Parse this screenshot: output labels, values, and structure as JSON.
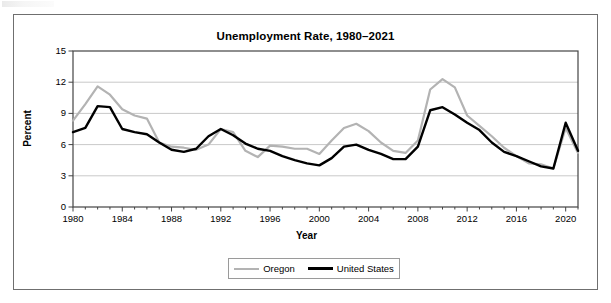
{
  "chart_data": {
    "type": "line",
    "title": "Unemployment Rate, 1980–2021",
    "xlabel": "Year",
    "ylabel": "Percent",
    "grid": true,
    "legend_position": "bottom",
    "xlim": [
      1980,
      2021
    ],
    "ylim": [
      0,
      15
    ],
    "yticks": [
      "0",
      "3",
      "6",
      "9",
      "12",
      "15"
    ],
    "ytick_values": [
      0,
      3,
      6,
      9,
      12,
      15
    ],
    "xticks": [
      "1980",
      "1984",
      "1988",
      "1992",
      "1996",
      "2000",
      "2004",
      "2008",
      "2012",
      "2016",
      "2020"
    ],
    "xtick_values": [
      1980,
      1984,
      1988,
      1992,
      1996,
      2000,
      2004,
      2008,
      2012,
      2016,
      2020
    ],
    "x": [
      1980,
      1981,
      1982,
      1983,
      1984,
      1985,
      1986,
      1987,
      1988,
      1989,
      1990,
      1991,
      1992,
      1993,
      1994,
      1995,
      1996,
      1997,
      1998,
      1999,
      2000,
      2001,
      2002,
      2003,
      2004,
      2005,
      2006,
      2007,
      2008,
      2009,
      2010,
      2011,
      2012,
      2013,
      2014,
      2015,
      2016,
      2017,
      2018,
      2019,
      2020,
      2021
    ],
    "series": [
      {
        "name": "Oregon",
        "color": "#b3b3b3",
        "values": [
          8.3,
          9.9,
          11.6,
          10.8,
          9.4,
          8.8,
          8.5,
          6.2,
          5.8,
          5.7,
          5.5,
          6.0,
          7.5,
          7.2,
          5.4,
          4.8,
          5.9,
          5.8,
          5.6,
          5.6,
          5.1,
          6.4,
          7.6,
          8.0,
          7.3,
          6.2,
          5.4,
          5.2,
          6.4,
          11.3,
          12.3,
          11.5,
          8.8,
          7.8,
          6.8,
          5.7,
          4.9,
          4.2,
          4.1,
          3.7,
          7.6,
          5.2
        ]
      },
      {
        "name": "United States",
        "color": "#000000",
        "values": [
          7.2,
          7.6,
          9.7,
          9.6,
          7.5,
          7.2,
          7.0,
          6.2,
          5.5,
          5.3,
          5.6,
          6.8,
          7.5,
          6.9,
          6.1,
          5.6,
          5.4,
          4.9,
          4.5,
          4.2,
          4.0,
          4.7,
          5.8,
          6.0,
          5.5,
          5.1,
          4.6,
          4.6,
          5.8,
          9.3,
          9.6,
          8.9,
          8.1,
          7.4,
          6.2,
          5.3,
          4.9,
          4.4,
          3.9,
          3.7,
          8.1,
          5.4
        ]
      }
    ]
  },
  "legend": {
    "items": [
      {
        "label": "Oregon"
      },
      {
        "label": "United States"
      }
    ]
  }
}
